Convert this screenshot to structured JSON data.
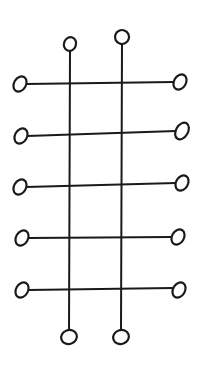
{
  "diagram": {
    "type": "ladder-grid",
    "stroke_color": "#1a1a1a",
    "background": "#ffffff",
    "verticals": [
      {
        "x": 70,
        "y_top": 44,
        "y_bottom": 337,
        "top_node": {
          "cx": 70,
          "cy": 44,
          "rx": 6,
          "ry": 7
        },
        "bottom_node": {
          "cx": 69,
          "cy": 337,
          "rx": 8,
          "ry": 7
        }
      },
      {
        "x": 121,
        "y_top": 37,
        "y_bottom": 337,
        "top_node": {
          "cx": 122,
          "cy": 37,
          "rx": 7,
          "ry": 7
        },
        "bottom_node": {
          "cx": 121,
          "cy": 337,
          "rx": 8,
          "ry": 7
        }
      }
    ],
    "horizontals": [
      {
        "y_left": 84,
        "y_right": 82,
        "left_node": {
          "cx": 20,
          "cy": 84,
          "rx": 6,
          "ry": 8
        },
        "right_node": {
          "cx": 180,
          "cy": 82,
          "rx": 6,
          "ry": 8
        }
      },
      {
        "y_left": 136,
        "y_right": 131,
        "left_node": {
          "cx": 21,
          "cy": 136,
          "rx": 6,
          "ry": 8
        },
        "right_node": {
          "cx": 182,
          "cy": 131,
          "rx": 6,
          "ry": 9
        }
      },
      {
        "y_left": 187,
        "y_right": 183,
        "left_node": {
          "cx": 20,
          "cy": 187,
          "rx": 6,
          "ry": 8
        },
        "right_node": {
          "cx": 182,
          "cy": 183,
          "rx": 6,
          "ry": 8
        }
      },
      {
        "y_left": 238,
        "y_right": 237,
        "left_node": {
          "cx": 22,
          "cy": 238,
          "rx": 6,
          "ry": 8
        },
        "right_node": {
          "cx": 178,
          "cy": 237,
          "rx": 6,
          "ry": 8
        }
      },
      {
        "y_left": 290,
        "y_right": 288,
        "left_node": {
          "cx": 22,
          "cy": 290,
          "rx": 6,
          "ry": 8
        },
        "right_node": {
          "cx": 179,
          "cy": 290,
          "rx": 6,
          "ry": 8
        }
      }
    ]
  }
}
